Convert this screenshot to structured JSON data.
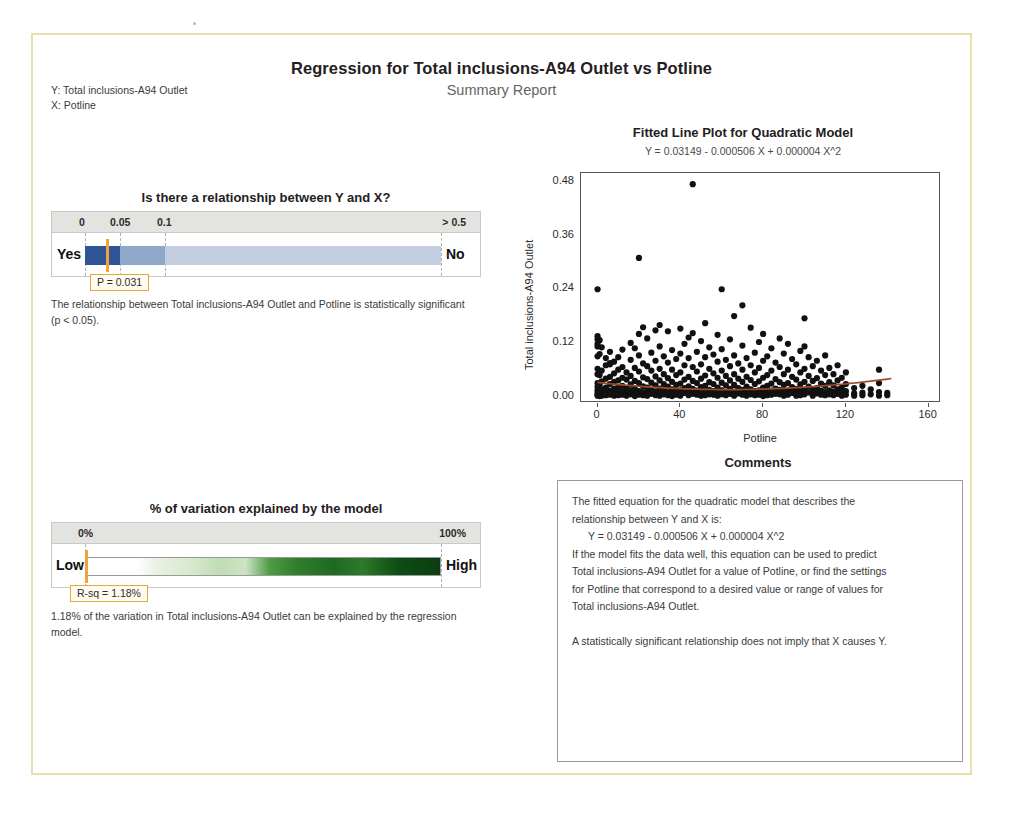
{
  "report": {
    "title": "Regression for Total inclusions-A94 Outlet vs Potline",
    "subtitle": "Summary Report",
    "y_label": "Y: Total inclusions-A94 Outlet",
    "x_label": "X: Potline",
    "response": "Total inclusions-A94 Outlet",
    "predictor": "Potline",
    "border_color": "#e8e0a8"
  },
  "pvalue_panel": {
    "heading": "Is there a relationship between Y and X?",
    "scale_labels": [
      "0",
      "0.05",
      "0.1",
      "> 0.5"
    ],
    "left_end_label": "Yes",
    "right_end_label": "No",
    "callout": "P = 0.031",
    "p_value": 0.031,
    "note": "The relationship between Total inclusions-A94 Outlet and Potline is statistically significant (p < 0.05).",
    "marker_color": "#f0a23c",
    "segment_colors": [
      "#2f5597",
      "#8fa7c9",
      "#c3cfe0"
    ]
  },
  "rsq_panel": {
    "heading": "% of variation explained by the model",
    "scale_labels": [
      "0%",
      "100%"
    ],
    "left_end_label": "Low",
    "right_end_label": "High",
    "callout": "R-sq = 1.18%",
    "r_sq": 1.18,
    "note": "1.18% of the variation in Total inclusions-A94 Outlet can be explained by the regression model.",
    "marker_color": "#f0a23c"
  },
  "comments": {
    "heading": "Comments",
    "line1": "The fitted equation for the quadratic model that describes the",
    "line2": "relationship between Y and X is:",
    "line3": "Y = 0.03149 - 0.000506 X + 0.000004 X^2",
    "line4": "If the model fits the data well, this equation can be used to predict",
    "line5": "Total inclusions-A94 Outlet for a value of Potline, or find the settings",
    "line6": "for Potline that correspond to a desired value or range of values for",
    "line7": "Total inclusions-A94 Outlet.",
    "line8": "A statistically significant relationship does not imply that X causes Y."
  },
  "chart_data": {
    "type": "scatter",
    "title": "Fitted Line Plot for Quadratic Model",
    "subtitle": "Y = 0.03149 - 0.000506 X + 0.000004 X^2",
    "xlabel": "Potline",
    "ylabel": "Total inclusions-A94 Outlet",
    "xlim": [
      -8,
      165
    ],
    "ylim": [
      -0.01,
      0.5
    ],
    "xticks": [
      0,
      40,
      80,
      120,
      160
    ],
    "yticks": [
      "0.00",
      "0.12",
      "0.24",
      "0.36",
      "0.48"
    ],
    "ytick_values": [
      0.0,
      0.12,
      0.24,
      0.36,
      0.48
    ],
    "grid": false,
    "legend": "none",
    "fit_color": "#9c4a28",
    "point_color": "#111111",
    "fit_equation": {
      "intercept": 0.03149,
      "linear": -0.000506,
      "quadratic": 4e-06
    },
    "points": [
      [
        0,
        0.24
      ],
      [
        0,
        0.135
      ],
      [
        0,
        0.128
      ],
      [
        0,
        0.118
      ],
      [
        0,
        0.112
      ],
      [
        0,
        0.09
      ],
      [
        0,
        0.062
      ],
      [
        0,
        0.05
      ],
      [
        0,
        0.03
      ],
      [
        0,
        0.022
      ],
      [
        0,
        0.014
      ],
      [
        0,
        0.008
      ],
      [
        0,
        0.004
      ],
      [
        0,
        0.002
      ],
      [
        1,
        0.126
      ],
      [
        1,
        0.095
      ],
      [
        1,
        0.048
      ],
      [
        1,
        0.026
      ],
      [
        1,
        0.012
      ],
      [
        1,
        0.005
      ],
      [
        1,
        0.001
      ],
      [
        2,
        0.11
      ],
      [
        2,
        0.058
      ],
      [
        2,
        0.034
      ],
      [
        2,
        0.016
      ],
      [
        2,
        0.006
      ],
      [
        2,
        0.002
      ],
      [
        4,
        0.086
      ],
      [
        4,
        0.07
      ],
      [
        4,
        0.04
      ],
      [
        4,
        0.02
      ],
      [
        4,
        0.01
      ],
      [
        4,
        0.003
      ],
      [
        6,
        0.1
      ],
      [
        6,
        0.075
      ],
      [
        6,
        0.072
      ],
      [
        6,
        0.044
      ],
      [
        6,
        0.028
      ],
      [
        6,
        0.013
      ],
      [
        6,
        0.004
      ],
      [
        8,
        0.078
      ],
      [
        8,
        0.052
      ],
      [
        8,
        0.033
      ],
      [
        8,
        0.018
      ],
      [
        8,
        0.007
      ],
      [
        8,
        0.002
      ],
      [
        10,
        0.088
      ],
      [
        10,
        0.06
      ],
      [
        10,
        0.036
      ],
      [
        10,
        0.021
      ],
      [
        10,
        0.009
      ],
      [
        10,
        0.003
      ],
      [
        12,
        0.105
      ],
      [
        12,
        0.066
      ],
      [
        12,
        0.042
      ],
      [
        12,
        0.024
      ],
      [
        12,
        0.011
      ],
      [
        12,
        0.004
      ],
      [
        14,
        0.054
      ],
      [
        14,
        0.038
      ],
      [
        14,
        0.019
      ],
      [
        14,
        0.008
      ],
      [
        14,
        0.002
      ],
      [
        16,
        0.12
      ],
      [
        16,
        0.082
      ],
      [
        16,
        0.046
      ],
      [
        16,
        0.027
      ],
      [
        16,
        0.014
      ],
      [
        16,
        0.005
      ],
      [
        18,
        0.108
      ],
      [
        18,
        0.064
      ],
      [
        18,
        0.035
      ],
      [
        18,
        0.017
      ],
      [
        18,
        0.006
      ],
      [
        18,
        0.001
      ],
      [
        20,
        0.31
      ],
      [
        20,
        0.14
      ],
      [
        20,
        0.092
      ],
      [
        20,
        0.056
      ],
      [
        20,
        0.03
      ],
      [
        20,
        0.012
      ],
      [
        20,
        0.004
      ],
      [
        22,
        0.155
      ],
      [
        22,
        0.074
      ],
      [
        22,
        0.043
      ],
      [
        22,
        0.023
      ],
      [
        22,
        0.01
      ],
      [
        22,
        0.003
      ],
      [
        24,
        0.13
      ],
      [
        24,
        0.068
      ],
      [
        24,
        0.039
      ],
      [
        24,
        0.02
      ],
      [
        24,
        0.008
      ],
      [
        24,
        0.002
      ],
      [
        26,
        0.098
      ],
      [
        26,
        0.058
      ],
      [
        26,
        0.031
      ],
      [
        26,
        0.015
      ],
      [
        26,
        0.006
      ],
      [
        28,
        0.148
      ],
      [
        28,
        0.08
      ],
      [
        28,
        0.045
      ],
      [
        28,
        0.025
      ],
      [
        28,
        0.011
      ],
      [
        28,
        0.003
      ],
      [
        30,
        0.16
      ],
      [
        30,
        0.112
      ],
      [
        30,
        0.062
      ],
      [
        30,
        0.036
      ],
      [
        30,
        0.018
      ],
      [
        30,
        0.007
      ],
      [
        30,
        0.002
      ],
      [
        32,
        0.09
      ],
      [
        32,
        0.05
      ],
      [
        32,
        0.028
      ],
      [
        32,
        0.013
      ],
      [
        32,
        0.005
      ],
      [
        34,
        0.146
      ],
      [
        34,
        0.076
      ],
      [
        34,
        0.041
      ],
      [
        34,
        0.022
      ],
      [
        34,
        0.009
      ],
      [
        34,
        0.003
      ],
      [
        36,
        0.104
      ],
      [
        36,
        0.06
      ],
      [
        36,
        0.033
      ],
      [
        36,
        0.016
      ],
      [
        36,
        0.006
      ],
      [
        36,
        0.001
      ],
      [
        38,
        0.084
      ],
      [
        38,
        0.048
      ],
      [
        38,
        0.026
      ],
      [
        38,
        0.012
      ],
      [
        38,
        0.004
      ],
      [
        40,
        0.152
      ],
      [
        40,
        0.096
      ],
      [
        40,
        0.054
      ],
      [
        40,
        0.029
      ],
      [
        40,
        0.014
      ],
      [
        40,
        0.005
      ],
      [
        40,
        0.002
      ],
      [
        42,
        0.118
      ],
      [
        42,
        0.07
      ],
      [
        42,
        0.038
      ],
      [
        42,
        0.019
      ],
      [
        42,
        0.008
      ],
      [
        44,
        0.132
      ],
      [
        44,
        0.086
      ],
      [
        44,
        0.044
      ],
      [
        44,
        0.023
      ],
      [
        44,
        0.01
      ],
      [
        44,
        0.003
      ],
      [
        46,
        0.475
      ],
      [
        46,
        0.142
      ],
      [
        46,
        0.066
      ],
      [
        46,
        0.035
      ],
      [
        46,
        0.017
      ],
      [
        46,
        0.006
      ],
      [
        48,
        0.1
      ],
      [
        48,
        0.056
      ],
      [
        48,
        0.03
      ],
      [
        48,
        0.013
      ],
      [
        48,
        0.004
      ],
      [
        50,
        0.124
      ],
      [
        50,
        0.072
      ],
      [
        50,
        0.04
      ],
      [
        50,
        0.021
      ],
      [
        50,
        0.009
      ],
      [
        50,
        0.002
      ],
      [
        52,
        0.164
      ],
      [
        52,
        0.088
      ],
      [
        52,
        0.047
      ],
      [
        52,
        0.024
      ],
      [
        52,
        0.011
      ],
      [
        52,
        0.003
      ],
      [
        54,
        0.11
      ],
      [
        54,
        0.062
      ],
      [
        54,
        0.032
      ],
      [
        54,
        0.015
      ],
      [
        54,
        0.005
      ],
      [
        56,
        0.094
      ],
      [
        56,
        0.052
      ],
      [
        56,
        0.028
      ],
      [
        56,
        0.012
      ],
      [
        56,
        0.004
      ],
      [
        58,
        0.138
      ],
      [
        58,
        0.078
      ],
      [
        58,
        0.042
      ],
      [
        58,
        0.02
      ],
      [
        58,
        0.008
      ],
      [
        58,
        0.002
      ],
      [
        60,
        0.24
      ],
      [
        60,
        0.106
      ],
      [
        60,
        0.058
      ],
      [
        60,
        0.031
      ],
      [
        60,
        0.014
      ],
      [
        60,
        0.005
      ],
      [
        62,
        0.082
      ],
      [
        62,
        0.046
      ],
      [
        62,
        0.025
      ],
      [
        62,
        0.01
      ],
      [
        62,
        0.003
      ],
      [
        64,
        0.128
      ],
      [
        64,
        0.068
      ],
      [
        64,
        0.036
      ],
      [
        64,
        0.017
      ],
      [
        64,
        0.006
      ],
      [
        66,
        0.18
      ],
      [
        66,
        0.092
      ],
      [
        66,
        0.05
      ],
      [
        66,
        0.026
      ],
      [
        66,
        0.011
      ],
      [
        66,
        0.002
      ],
      [
        68,
        0.074
      ],
      [
        68,
        0.04
      ],
      [
        68,
        0.019
      ],
      [
        68,
        0.007
      ],
      [
        70,
        0.204
      ],
      [
        70,
        0.114
      ],
      [
        70,
        0.06
      ],
      [
        70,
        0.033
      ],
      [
        70,
        0.015
      ],
      [
        70,
        0.004
      ],
      [
        72,
        0.086
      ],
      [
        72,
        0.044
      ],
      [
        72,
        0.022
      ],
      [
        72,
        0.009
      ],
      [
        72,
        0.002
      ],
      [
        74,
        0.154
      ],
      [
        74,
        0.07
      ],
      [
        74,
        0.037
      ],
      [
        74,
        0.016
      ],
      [
        74,
        0.005
      ],
      [
        76,
        0.098
      ],
      [
        76,
        0.054
      ],
      [
        76,
        0.028
      ],
      [
        76,
        0.012
      ],
      [
        76,
        0.003
      ],
      [
        78,
        0.122
      ],
      [
        78,
        0.064
      ],
      [
        78,
        0.034
      ],
      [
        78,
        0.014
      ],
      [
        78,
        0.004
      ],
      [
        80,
        0.14
      ],
      [
        80,
        0.08
      ],
      [
        80,
        0.042
      ],
      [
        80,
        0.02
      ],
      [
        80,
        0.008
      ],
      [
        80,
        0.001
      ],
      [
        82,
        0.09
      ],
      [
        82,
        0.048
      ],
      [
        82,
        0.024
      ],
      [
        82,
        0.01
      ],
      [
        82,
        0.003
      ],
      [
        84,
        0.108
      ],
      [
        84,
        0.058
      ],
      [
        84,
        0.029
      ],
      [
        84,
        0.013
      ],
      [
        84,
        0.004
      ],
      [
        86,
        0.076
      ],
      [
        86,
        0.039
      ],
      [
        86,
        0.018
      ],
      [
        86,
        0.006
      ],
      [
        88,
        0.13
      ],
      [
        88,
        0.066
      ],
      [
        88,
        0.032
      ],
      [
        88,
        0.015
      ],
      [
        88,
        0.005
      ],
      [
        90,
        0.096
      ],
      [
        90,
        0.05
      ],
      [
        90,
        0.026
      ],
      [
        90,
        0.011
      ],
      [
        90,
        0.002
      ],
      [
        92,
        0.118
      ],
      [
        92,
        0.06
      ],
      [
        92,
        0.03
      ],
      [
        92,
        0.013
      ],
      [
        92,
        0.004
      ],
      [
        94,
        0.084
      ],
      [
        94,
        0.044
      ],
      [
        94,
        0.021
      ],
      [
        94,
        0.008
      ],
      [
        96,
        0.072
      ],
      [
        96,
        0.038
      ],
      [
        96,
        0.017
      ],
      [
        96,
        0.006
      ],
      [
        96,
        0.002
      ],
      [
        98,
        0.102
      ],
      [
        98,
        0.054
      ],
      [
        98,
        0.027
      ],
      [
        98,
        0.012
      ],
      [
        98,
        0.003
      ],
      [
        100,
        0.175
      ],
      [
        100,
        0.112
      ],
      [
        100,
        0.062
      ],
      [
        100,
        0.033
      ],
      [
        100,
        0.015
      ],
      [
        100,
        0.005
      ],
      [
        102,
        0.088
      ],
      [
        102,
        0.046
      ],
      [
        102,
        0.022
      ],
      [
        102,
        0.009
      ],
      [
        104,
        0.068
      ],
      [
        104,
        0.035
      ],
      [
        104,
        0.016
      ],
      [
        104,
        0.006
      ],
      [
        104,
        0.002
      ],
      [
        106,
        0.08
      ],
      [
        106,
        0.041
      ],
      [
        106,
        0.019
      ],
      [
        106,
        0.007
      ],
      [
        108,
        0.058
      ],
      [
        108,
        0.029
      ],
      [
        108,
        0.013
      ],
      [
        108,
        0.004
      ],
      [
        110,
        0.092
      ],
      [
        110,
        0.048
      ],
      [
        110,
        0.024
      ],
      [
        110,
        0.01
      ],
      [
        110,
        0.003
      ],
      [
        112,
        0.064
      ],
      [
        112,
        0.032
      ],
      [
        112,
        0.014
      ],
      [
        112,
        0.005
      ],
      [
        114,
        0.05
      ],
      [
        114,
        0.025
      ],
      [
        114,
        0.011
      ],
      [
        114,
        0.003
      ],
      [
        116,
        0.07
      ],
      [
        116,
        0.036
      ],
      [
        116,
        0.016
      ],
      [
        116,
        0.006
      ],
      [
        118,
        0.042
      ],
      [
        118,
        0.02
      ],
      [
        118,
        0.008
      ],
      [
        118,
        0.002
      ],
      [
        120,
        0.054
      ],
      [
        120,
        0.028
      ],
      [
        120,
        0.012
      ],
      [
        120,
        0.004
      ],
      [
        124,
        0.019
      ],
      [
        124,
        0.007
      ],
      [
        124,
        0.002
      ],
      [
        128,
        0.024
      ],
      [
        128,
        0.009
      ],
      [
        128,
        0.003
      ],
      [
        132,
        0.016
      ],
      [
        132,
        0.005
      ],
      [
        136,
        0.06
      ],
      [
        136,
        0.03
      ],
      [
        136,
        0.01
      ],
      [
        136,
        0.002
      ],
      [
        140,
        0.008
      ],
      [
        140,
        0.003
      ]
    ]
  }
}
